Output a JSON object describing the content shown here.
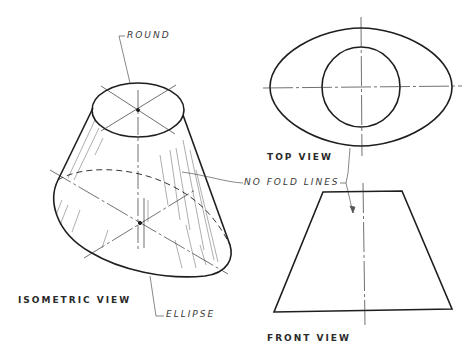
{
  "figure": {
    "views": {
      "isometric": "ISOMETRIC VIEW",
      "top": "TOP VIEW",
      "front": "FRONT VIEW"
    },
    "callouts": {
      "round": "ROUND",
      "ellipse": "ELLIPSE",
      "no_fold_lines": "NO FOLD LINES"
    },
    "colors": {
      "line": "#1e1e1e",
      "thin": "#555555",
      "background": "#ffffff"
    }
  }
}
